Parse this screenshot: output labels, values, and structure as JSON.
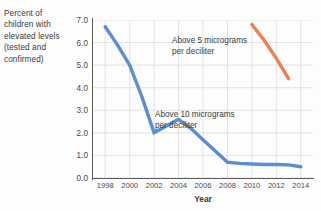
{
  "chart_data": {
    "type": "line",
    "title": "",
    "ylabel": "Percent of children with elevated levels (tested and confirmed)",
    "xlabel": "Year",
    "xlim": [
      1997,
      2015
    ],
    "ylim": [
      0.0,
      7.0
    ],
    "grid": true,
    "legend_position": "inline-annotations",
    "y_ticks": [
      "7.0",
      "6.0",
      "5.0",
      "4.0",
      "3.0",
      "2.0",
      "1.0",
      "0.0"
    ],
    "y_tick_values": [
      7.0,
      6.0,
      5.0,
      4.0,
      3.0,
      2.0,
      1.0,
      0.0
    ],
    "x_ticks": [
      "1998",
      "2000",
      "2002",
      "2004",
      "2006",
      "2008",
      "2010",
      "2012",
      "2014"
    ],
    "x_tick_values": [
      1998,
      2000,
      2002,
      2004,
      2006,
      2008,
      2010,
      2012,
      2014
    ],
    "series": [
      {
        "name": "Above 10 micrograms per deciliter",
        "color": "#5b8fd4",
        "x": [
          1998,
          1999,
          2000,
          2001,
          2002,
          2003,
          2004,
          2005,
          2006,
          2007,
          2008,
          2009,
          2010,
          2011,
          2012,
          2013,
          2014
        ],
        "values": [
          6.7,
          5.9,
          5.0,
          3.6,
          2.0,
          2.3,
          2.6,
          2.2,
          1.7,
          1.2,
          0.7,
          0.65,
          0.62,
          0.6,
          0.6,
          0.58,
          0.5
        ]
      },
      {
        "name": "Above 5 micrograms per deciliter",
        "color": "#ef8050",
        "x": [
          2010,
          2011,
          2012,
          2013
        ],
        "values": [
          6.8,
          6.1,
          5.3,
          4.4
        ]
      }
    ],
    "annotations": [
      {
        "id": "above-5",
        "text": "Above 5 micrograms\nper deciliter",
        "series": "Above 5 micrograms per deciliter"
      },
      {
        "id": "above-10",
        "text": "Above 10 micrograms\nper deciliter",
        "series": "Above 10 micrograms per deciliter"
      }
    ]
  },
  "axis": {
    "ylabel_text": "Percent of children with elevated levels (tested and confirmed)",
    "xlabel_text": "Year"
  }
}
